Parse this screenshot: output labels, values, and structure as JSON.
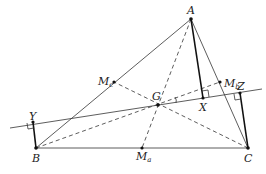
{
  "diagram": {
    "type": "triangle-centroid-perpendiculars",
    "colors": {
      "stroke": "#333333",
      "thick_stroke": "#111111",
      "label": "#222222",
      "background": "#ffffff"
    },
    "points": {
      "A": {
        "label": "A",
        "sub": "",
        "x": 191,
        "y": 19
      },
      "B": {
        "label": "B",
        "sub": "",
        "x": 36,
        "y": 148
      },
      "C": {
        "label": "C",
        "sub": "",
        "x": 248,
        "y": 148
      },
      "G": {
        "label": "G",
        "sub": "",
        "x": 158,
        "y": 105
      },
      "Ma": {
        "label": "M",
        "sub": "a",
        "x": 142,
        "y": 148
      },
      "Mb": {
        "label": "M",
        "sub": "b",
        "x": 220,
        "y": 82
      },
      "Mc": {
        "label": "M",
        "sub": "c",
        "x": 114,
        "y": 82
      },
      "X": {
        "label": "X",
        "sub": "",
        "x": 203,
        "y": 98
      },
      "Y": {
        "label": "Y",
        "sub": "",
        "x": 33,
        "y": 122
      },
      "Z": {
        "label": "Z",
        "sub": "",
        "x": 240,
        "y": 93
      }
    },
    "segments": {
      "triangle_sides": [
        "AB",
        "BC",
        "CA"
      ],
      "medians_dashed": [
        "AMa",
        "BMb",
        "CMc"
      ],
      "perpendiculars_thick": [
        "AX",
        "BY",
        "CZ"
      ],
      "line_through_G": {
        "from": [
          10,
          128
        ],
        "to": [
          262,
          89
        ]
      }
    },
    "right_angle_marks": [
      "X",
      "Y",
      "Z"
    ]
  }
}
